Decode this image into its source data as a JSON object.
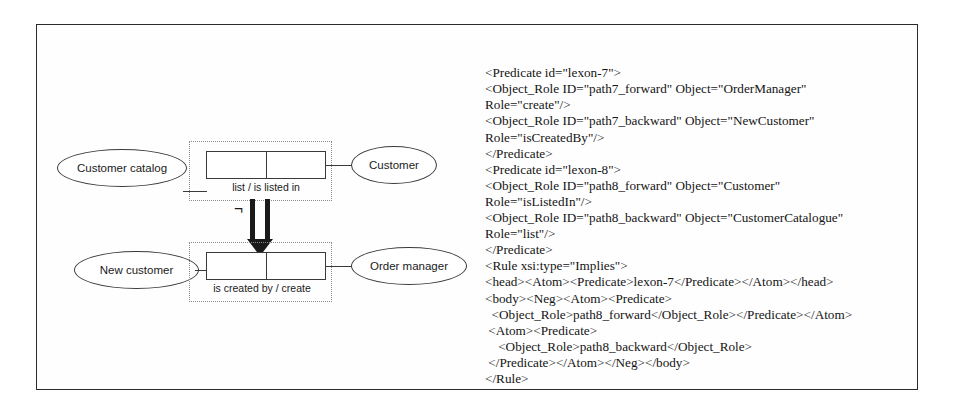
{
  "figure": {
    "diagram": {
      "top_row": {
        "left_concept": "Customer catalog",
        "right_concept": "Customer",
        "fact_label": "list /    is listed in"
      },
      "bottom_row": {
        "left_concept": "New customer",
        "right_concept": "Order manager",
        "fact_label": "is created by  /   create"
      },
      "negation_symbol": "¬"
    },
    "xml": {
      "lines": [
        "<Predicate id=\"lexon-7\">",
        "<Object_Role ID=\"path7_forward\" Object=\"OrderManager\"",
        "Role=\"create\"/>",
        "<Object_Role ID=\"path7_backward\" Object=\"NewCustomer\"",
        "Role=\"isCreatedBy\"/>",
        "</Predicate>",
        "<Predicate id=\"lexon-8\">",
        "<Object_Role ID=\"path8_forward\" Object=\"Customer\"",
        "Role=\"isListedIn\"/>",
        "<Object_Role ID=\"path8_backward\" Object=\"CustomerCatalogue\"",
        "Role=\"list\"/>",
        "</Predicate>",
        "<Rule xsi:type=\"Implies\">",
        "<head><Atom><Predicate>lexon-7</Predicate></Atom></head>",
        "<body><Neg><Atom><Predicate>",
        "  <Object_Role>path8_forward</Object_Role></Predicate></Atom>",
        " <Atom><Predicate>",
        "    <Object_Role>path8_backward</Object_Role>",
        " </Predicate></Atom></Neg></body>",
        "</Rule>"
      ],
      "ellipsis": "..."
    },
    "colors": {
      "frame_border": "#2b2b2b",
      "shape_stroke": "#3a3a3a",
      "dotted_region": "#8a8a8a",
      "text": "#141414"
    }
  }
}
